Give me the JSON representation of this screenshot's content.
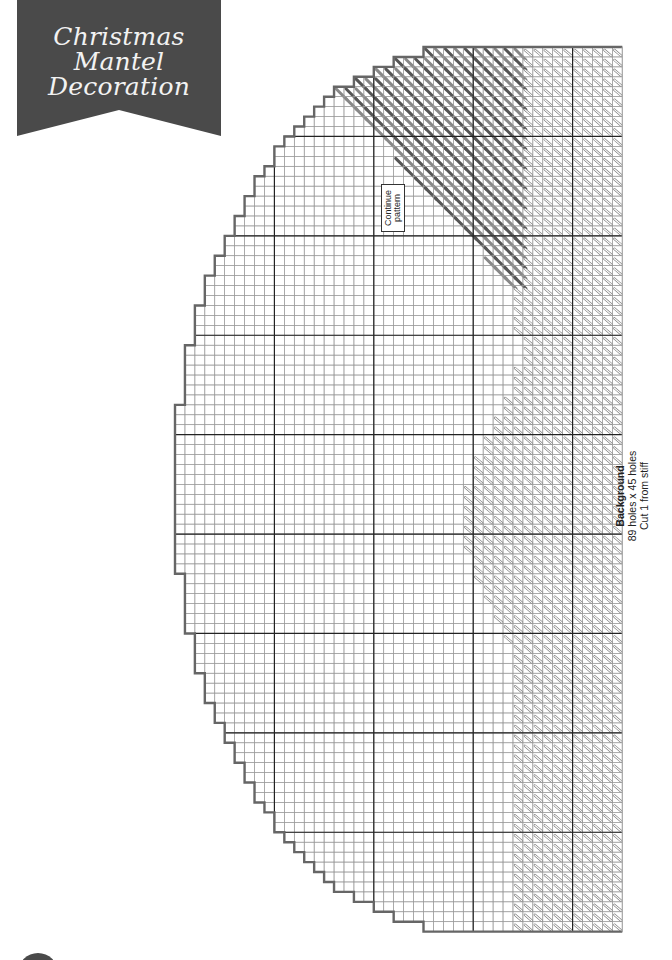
{
  "banner": {
    "lines": [
      "Christmas",
      "Mantel",
      "Decoration"
    ],
    "color": "#4a4a4a"
  },
  "pattern": {
    "name": "Background",
    "size_label": "89 holes x 45 holes",
    "cut_label": "Cut 1 from stiff",
    "note_line1": "Continue",
    "note_line2": "pattern",
    "rows": 89,
    "cols": 45,
    "origin_x": 175,
    "origin_y": 47,
    "cell": 9.94,
    "major_every": 10,
    "colors": {
      "grid_minor": "#9a9a9a",
      "grid_major": "#222222",
      "outline": "#666666",
      "dark_stitch": "#555555",
      "light_stitch": "#888888"
    }
  }
}
